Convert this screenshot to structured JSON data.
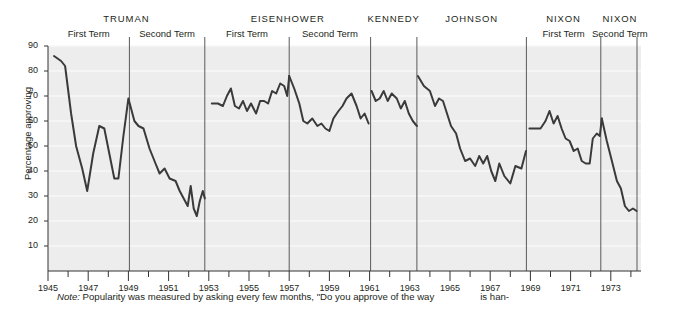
{
  "figure": {
    "ylabel": "Percentage approving",
    "note_prefix": "Note:",
    "note_text": "Popularity was measured by asking every few months, \"Do you approve of the way",
    "note_text_2": "is han-"
  },
  "presidents": [
    {
      "name": "TRUMAN",
      "terms": [
        "First Term",
        "Second Term"
      ]
    },
    {
      "name": "EISENHOWER",
      "terms": [
        "First Term",
        "Second Term"
      ]
    },
    {
      "name": "KENNEDY",
      "terms": []
    },
    {
      "name": "JOHNSON",
      "terms": []
    },
    {
      "name": "NIXON",
      "terms": [
        "First Term"
      ]
    },
    {
      "name": "NIXON",
      "terms": [
        "Second Term"
      ]
    }
  ],
  "chart_data": {
    "type": "line",
    "title": "",
    "xlabel": "",
    "ylabel": "Percentage approving",
    "ylim": [
      0,
      90
    ],
    "xlim": [
      1945,
      1974.5
    ],
    "yticks": [
      10,
      20,
      30,
      40,
      50,
      60,
      70,
      80,
      90
    ],
    "ytick_labels": [
      "10",
      "20",
      "30",
      "40",
      "50",
      "60",
      "70",
      "80",
      "90"
    ],
    "xticks": [
      1945,
      1946,
      1947,
      1948,
      1949,
      1950,
      1951,
      1952,
      1953,
      1954,
      1955,
      1956,
      1957,
      1958,
      1959,
      1960,
      1961,
      1962,
      1963,
      1964,
      1965,
      1966,
      1967,
      1968,
      1969,
      1970,
      1971,
      1972,
      1973,
      1974
    ],
    "xtick_labels_major": [
      "1945",
      "1947",
      "1949",
      "1951",
      "1953",
      "1955",
      "1957",
      "1959",
      "1961",
      "1963",
      "1965",
      "1967",
      "1969",
      "1971",
      "1973"
    ],
    "grid": "horizontal-light",
    "legend": "none",
    "line_color": "#3a3a3a",
    "plot_bg": "#ededed",
    "divider_color": "#5a5a5a",
    "term_dividers": [
      1949.05,
      1952.8,
      1957.0,
      1961.05,
      1963.35,
      1968.8,
      1972.5,
      1974.3
    ],
    "series": [
      {
        "name": "Presidential approval",
        "points": [
          [
            1945.3,
            86
          ],
          [
            1945.65,
            84
          ],
          [
            1945.85,
            82
          ],
          [
            1946.15,
            63
          ],
          [
            1946.4,
            50
          ],
          [
            1946.7,
            41
          ],
          [
            1946.95,
            32
          ],
          [
            1947.25,
            47
          ],
          [
            1947.55,
            58
          ],
          [
            1947.8,
            57
          ],
          [
            1948.05,
            47
          ],
          [
            1948.3,
            37
          ],
          [
            1948.5,
            37
          ],
          [
            1948.75,
            54
          ],
          [
            1949.0,
            69
          ],
          [
            1949.3,
            60
          ],
          [
            1949.5,
            58
          ],
          [
            1949.75,
            57
          ],
          [
            1950.05,
            49
          ],
          [
            1950.35,
            43
          ],
          [
            1950.55,
            39
          ],
          [
            1950.8,
            41
          ],
          [
            1951.05,
            37
          ],
          [
            1951.35,
            36
          ],
          [
            1951.55,
            32
          ],
          [
            1951.75,
            29
          ],
          [
            1951.95,
            26
          ],
          [
            1952.1,
            34
          ],
          [
            1952.25,
            25
          ],
          [
            1952.4,
            22
          ],
          [
            1952.55,
            28
          ],
          [
            1952.7,
            32
          ],
          [
            1952.8,
            29
          ]
        ]
      },
      {
        "name": "Eisenhower first term",
        "points": [
          [
            1953.15,
            67
          ],
          [
            1953.45,
            67
          ],
          [
            1953.7,
            66
          ],
          [
            1953.9,
            70
          ],
          [
            1954.1,
            73
          ],
          [
            1954.3,
            66
          ],
          [
            1954.5,
            65
          ],
          [
            1954.7,
            68
          ],
          [
            1954.9,
            64
          ],
          [
            1955.1,
            67
          ],
          [
            1955.35,
            63
          ],
          [
            1955.55,
            68
          ],
          [
            1955.75,
            68
          ],
          [
            1955.95,
            67
          ],
          [
            1956.15,
            72
          ],
          [
            1956.35,
            71
          ],
          [
            1956.55,
            75
          ],
          [
            1956.75,
            74
          ],
          [
            1956.9,
            70
          ],
          [
            1957.0,
            78
          ]
        ]
      },
      {
        "name": "Eisenhower second term",
        "points": [
          [
            1957.0,
            78
          ],
          [
            1957.25,
            73
          ],
          [
            1957.5,
            67
          ],
          [
            1957.7,
            60
          ],
          [
            1957.9,
            59
          ],
          [
            1958.15,
            61
          ],
          [
            1958.4,
            58
          ],
          [
            1958.6,
            59
          ],
          [
            1958.8,
            57
          ],
          [
            1959.0,
            56
          ],
          [
            1959.2,
            61
          ],
          [
            1959.45,
            64
          ],
          [
            1959.65,
            66
          ],
          [
            1959.85,
            69
          ],
          [
            1960.1,
            71
          ],
          [
            1960.35,
            66
          ],
          [
            1960.55,
            61
          ],
          [
            1960.75,
            63
          ],
          [
            1960.95,
            59
          ]
        ]
      },
      {
        "name": "Kennedy",
        "points": [
          [
            1961.1,
            72
          ],
          [
            1961.3,
            68
          ],
          [
            1961.5,
            69
          ],
          [
            1961.7,
            72
          ],
          [
            1961.9,
            68
          ],
          [
            1962.1,
            71
          ],
          [
            1962.35,
            69
          ],
          [
            1962.55,
            65
          ],
          [
            1962.75,
            68
          ],
          [
            1962.95,
            63
          ],
          [
            1963.15,
            60
          ],
          [
            1963.35,
            58
          ]
        ]
      },
      {
        "name": "Johnson",
        "points": [
          [
            1963.4,
            78
          ],
          [
            1963.7,
            74
          ],
          [
            1964.0,
            72
          ],
          [
            1964.25,
            66
          ],
          [
            1964.45,
            69
          ],
          [
            1964.65,
            68
          ],
          [
            1964.85,
            63
          ],
          [
            1965.05,
            58
          ],
          [
            1965.3,
            55
          ],
          [
            1965.5,
            49
          ],
          [
            1965.75,
            44
          ],
          [
            1966.0,
            45
          ],
          [
            1966.25,
            42
          ],
          [
            1966.45,
            46
          ],
          [
            1966.65,
            43
          ],
          [
            1966.85,
            46
          ],
          [
            1967.05,
            40
          ],
          [
            1967.25,
            36
          ],
          [
            1967.45,
            43
          ],
          [
            1967.7,
            38
          ],
          [
            1968.0,
            35
          ],
          [
            1968.25,
            42
          ],
          [
            1968.55,
            41
          ],
          [
            1968.78,
            48
          ]
        ]
      },
      {
        "name": "Nixon first term",
        "points": [
          [
            1968.95,
            57
          ],
          [
            1969.25,
            57
          ],
          [
            1969.5,
            57
          ],
          [
            1969.75,
            60
          ],
          [
            1969.95,
            64
          ],
          [
            1970.15,
            59
          ],
          [
            1970.35,
            62
          ],
          [
            1970.55,
            57
          ],
          [
            1970.75,
            53
          ],
          [
            1970.95,
            52
          ],
          [
            1971.15,
            48
          ],
          [
            1971.35,
            49
          ],
          [
            1971.55,
            44
          ],
          [
            1971.75,
            43
          ],
          [
            1971.95,
            43
          ],
          [
            1972.1,
            53
          ],
          [
            1972.3,
            55
          ],
          [
            1972.45,
            54
          ],
          [
            1972.55,
            61
          ]
        ]
      },
      {
        "name": "Nixon second term",
        "points": [
          [
            1972.55,
            61
          ],
          [
            1972.8,
            52
          ],
          [
            1973.05,
            44
          ],
          [
            1973.3,
            36
          ],
          [
            1973.5,
            33
          ],
          [
            1973.7,
            26
          ],
          [
            1973.9,
            24
          ],
          [
            1974.1,
            25
          ],
          [
            1974.28,
            24
          ]
        ]
      }
    ]
  }
}
